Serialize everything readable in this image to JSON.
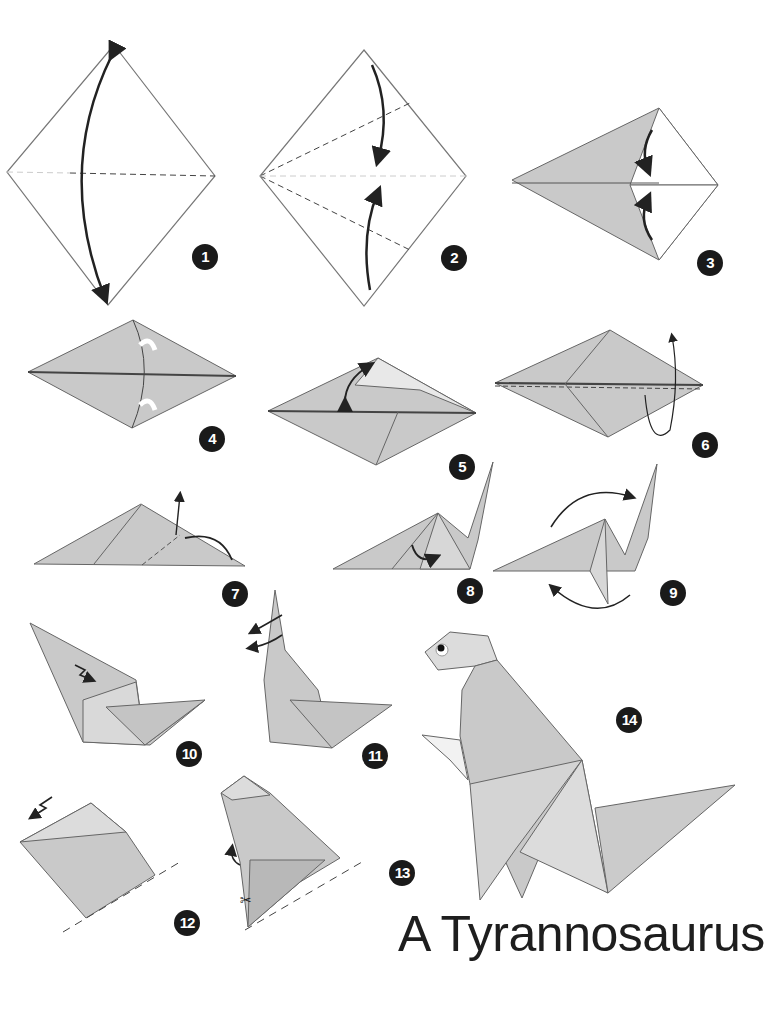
{
  "title": "A Tyrannosaurus",
  "colors": {
    "paper": "#c9c9c9",
    "paper_light": "#dcdcdc",
    "paper_dark": "#b0b0b0",
    "outline": "#555555",
    "badge": "#1a1a1a",
    "arrow": "#222222"
  },
  "steps": [
    {
      "number": "1",
      "label": "Square diamond, fold in half and unfold"
    },
    {
      "number": "2",
      "label": "Fold edges to center line"
    },
    {
      "number": "3",
      "label": "Fold edges to center line"
    },
    {
      "number": "4",
      "label": "Turn over"
    },
    {
      "number": "5",
      "label": "Squash fold"
    },
    {
      "number": "6",
      "label": "Fold in half"
    },
    {
      "number": "7",
      "label": "Inside reverse fold"
    },
    {
      "number": "8",
      "label": "Reverse fold"
    },
    {
      "number": "9",
      "label": "Rotate"
    },
    {
      "number": "10",
      "label": "Crimp fold"
    },
    {
      "number": "11",
      "label": "Reverse fold head"
    },
    {
      "number": "12",
      "label": "Pleat head, fold base"
    },
    {
      "number": "13",
      "label": "Cut and fold arms"
    },
    {
      "number": "14",
      "label": "Finished model"
    }
  ]
}
